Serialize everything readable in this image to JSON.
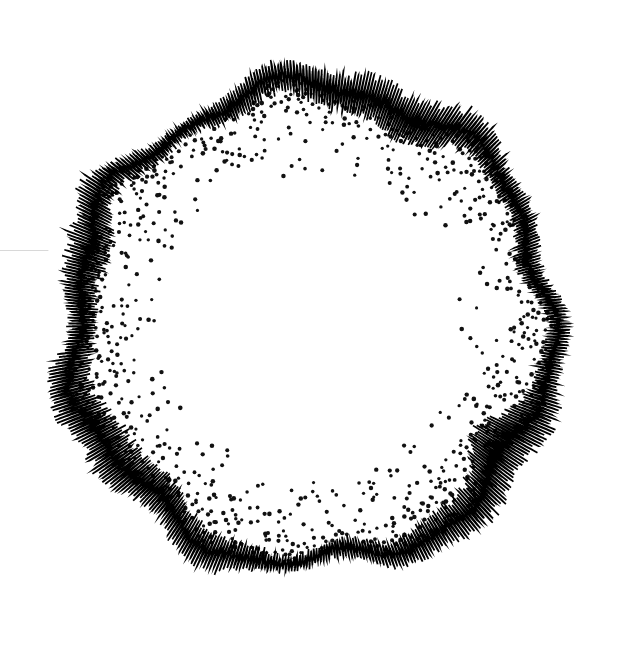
{
  "figure": {
    "background_color": "#ffffff",
    "ink_color": "#000000",
    "width": 619,
    "height": 653
  },
  "guide_line": {
    "name": "left-edge-guide-line",
    "color": "#d8d8d8",
    "x_start": 0,
    "x_end": 48,
    "y": 250,
    "thickness": 1
  },
  "chart_data": {
    "type": "scatter",
    "subtitle": "",
    "xlabel": "",
    "ylabel": "",
    "grid": false,
    "legend": null,
    "coordinate_system": "polar",
    "center": {
      "x": 311,
      "y": 325
    },
    "axis_ranges": {
      "theta_deg": [
        0,
        360
      ],
      "radius_px": [
        150,
        292
      ]
    },
    "layers": [
      {
        "name": "dot-field",
        "render": "dots",
        "color": "#111111",
        "dot_radius_px": 1.9,
        "radius_inner": 152,
        "radius_outer": 268,
        "angular_samples": 300,
        "radial_samples": 26,
        "density_profile": "increases with radius",
        "density_min": 0.06,
        "density_max": 0.92,
        "jitter_px": 4.2,
        "seed": 20514
      },
      {
        "name": "zigzag-trace",
        "render": "polyline",
        "color": "#000000",
        "stroke_width_px": 1.6,
        "baseline_radius": 238,
        "baseline_wobble_amp": 9,
        "baseline_wobble_cycles": 7,
        "samples": 22000,
        "teeth_per_revolution": 520,
        "amplitude_mean": 26,
        "amplitude_min": 7,
        "amplitude_max": 56,
        "amplitude_envelope_cycles": [
          3,
          5,
          8,
          13
        ],
        "amplitude_envelope_weights": [
          0.42,
          0.26,
          0.18,
          0.14
        ],
        "noise_amp": 0.34,
        "seed": 77413
      }
    ],
    "envelope_samples_deg": [
      0,
      30,
      60,
      90,
      120,
      150,
      180,
      210,
      240,
      270,
      300,
      330
    ],
    "envelope_amplitude_px": [
      34,
      46,
      22,
      30,
      52,
      28,
      18,
      40,
      55,
      25,
      44,
      20
    ]
  }
}
